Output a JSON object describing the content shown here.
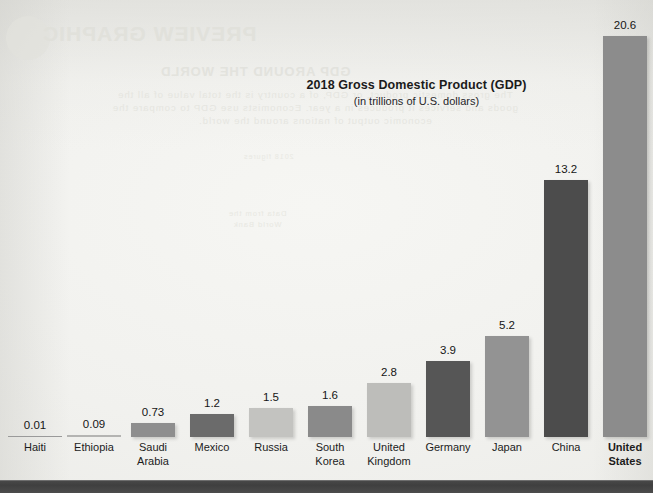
{
  "page": {
    "background_color": "#f1f1ee",
    "bottom_band_color": "#444444"
  },
  "bleed_through": {
    "note": "faint mirrored show-through text from the reverse side of the printed page",
    "heading": "PREVIEW GRAPHIC",
    "subheading": "GDP AROUND THE WORLD",
    "body_lines": [
      "The gross domestic product, or GDP, of a country is the total value of all the",
      "goods and services it produces in a year. Economists use GDP to compare the",
      "economic output of nations around the world."
    ],
    "small_lines": [
      "Data from the",
      "World Bank"
    ],
    "tiny_line": "2018 figures"
  },
  "chart_data": {
    "type": "bar",
    "title": "2018 Gross Domestic Product (GDP)",
    "subtitle": "(in trillions of U.S. dollars)",
    "xlabel": "",
    "ylabel": "",
    "ylim": [
      0,
      22
    ],
    "grid": false,
    "legend": null,
    "value_unit": "trillions of U.S. dollars",
    "categories": [
      "Haiti",
      "Ethiopia",
      "Saudi Arabia",
      "Mexico",
      "Russia",
      "South Korea",
      "United Kingdom",
      "Germany",
      "Japan",
      "China",
      "United States"
    ],
    "values": [
      0.01,
      0.09,
      0.73,
      1.2,
      1.5,
      1.6,
      2.8,
      3.9,
      5.2,
      13.2,
      20.6
    ],
    "value_labels": [
      "0.01",
      "0.09",
      "0.73",
      "1.2",
      "1.5",
      "1.6",
      "2.8",
      "3.9",
      "5.2",
      "13.2",
      "20.6"
    ],
    "bar_colors": [
      "#9a9a9a",
      "#b4b4b2",
      "#8e8e8e",
      "#6b6b6b",
      "#c3c3c0",
      "#8a8a8a",
      "#bdbdba",
      "#565656",
      "#939393",
      "#4c4c4c",
      "#8c8c8c"
    ],
    "emphasized_category": "United States"
  }
}
